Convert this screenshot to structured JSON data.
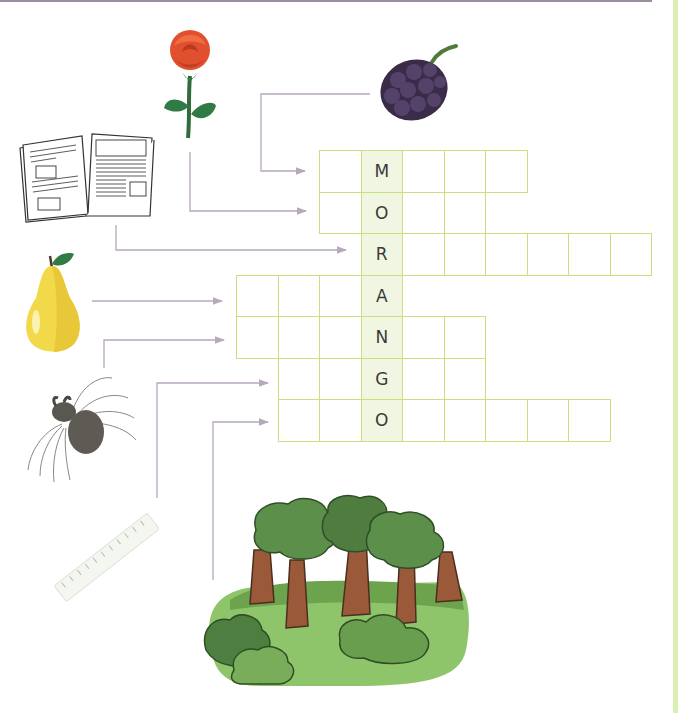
{
  "puzzle": {
    "title": "Crossword puzzle",
    "keyword": "MORANGO",
    "key_column": 3,
    "cell_size": 41.5,
    "origin": {
      "x": 236,
      "y": 150
    },
    "colors": {
      "grid_border": "#c8e07e",
      "key_fill": "#f0f6e2",
      "connector": "#b7a8bc",
      "top_rule": "#9b8e9e",
      "side_strip": "#dcefb4"
    },
    "rows": [
      {
        "clue": "blackberry",
        "start_col": 2,
        "end_col": 6,
        "key_letter": "M"
      },
      {
        "clue": "rose",
        "start_col": 2,
        "end_col": 5,
        "key_letter": "O"
      },
      {
        "clue": "book",
        "start_col": 3,
        "end_col": 9,
        "key_letter": "R"
      },
      {
        "clue": "pear",
        "start_col": 0,
        "end_col": 3,
        "key_letter": "A"
      },
      {
        "clue": "spider",
        "start_col": 0,
        "end_col": 5,
        "key_letter": "N"
      },
      {
        "clue": "ruler",
        "start_col": 1,
        "end_col": 5,
        "key_letter": "G"
      },
      {
        "clue": "forest",
        "start_col": 1,
        "end_col": 8,
        "key_letter": "O"
      }
    ]
  },
  "pictures": [
    {
      "name": "rose-picture",
      "label": "rose"
    },
    {
      "name": "blackberry-picture",
      "label": "blackberry"
    },
    {
      "name": "book-picture",
      "label": "book"
    },
    {
      "name": "pear-picture",
      "label": "pear"
    },
    {
      "name": "spider-picture",
      "label": "spider"
    },
    {
      "name": "ruler-picture",
      "label": "ruler"
    },
    {
      "name": "forest-picture",
      "label": "forest"
    }
  ]
}
